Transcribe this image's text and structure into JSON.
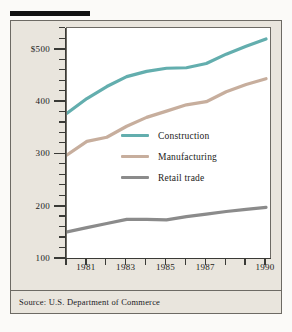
{
  "figure": {
    "source_note": "Source: U.S. Department of Commerce"
  },
  "legend": {
    "items": [
      {
        "label": "Construction",
        "color": "#63aeae"
      },
      {
        "label": "Manufacturing",
        "color": "#c7ae9d"
      },
      {
        "label": "Retail  trade",
        "color": "#8b8b8b"
      }
    ]
  },
  "axes": {
    "y_tick_labels": [
      "$500",
      "400",
      "300",
      "200",
      "100"
    ],
    "x_tick_labels": [
      "1981",
      "1983",
      "1985",
      "1987",
      "1990"
    ]
  },
  "colors": {
    "page_background": "#fbfaf8",
    "panel_background": "#e9e5dd",
    "plot_background": "#ffffff",
    "frame": "#6d6a64",
    "axis": "#3a3a36",
    "text": "#1b1b19",
    "top_rule": "#111111",
    "construction": "#63aeae",
    "manufacturing": "#c7ae9d",
    "retail_trade": "#8b8b8b"
  },
  "chart_data": {
    "type": "line",
    "title": "",
    "subtitle": "",
    "xlabel": "",
    "ylabel": "",
    "x": [
      1980,
      1981,
      1982,
      1983,
      1984,
      1985,
      1986,
      1987,
      1988,
      1989,
      1990
    ],
    "xlim": [
      1980,
      1990
    ],
    "ylim": [
      100,
      540
    ],
    "y_ticks_major": [
      100,
      200,
      300,
      400,
      500
    ],
    "y_ticks_minor_step": 20,
    "x_ticks": [
      1980,
      1981,
      1982,
      1983,
      1984,
      1985,
      1986,
      1987,
      1988,
      1989,
      1990
    ],
    "x_labeled_ticks": [
      1981,
      1983,
      1985,
      1987,
      1990
    ],
    "grid": false,
    "legend_position": "center-right",
    "series": [
      {
        "name": "Construction",
        "color": "#63aeae",
        "values": [
          377,
          405,
          428,
          447,
          457,
          463,
          464,
          472,
          490,
          505,
          519
        ]
      },
      {
        "name": "Manufacturing",
        "color": "#c7ae9d",
        "values": [
          297,
          323,
          331,
          352,
          369,
          381,
          393,
          399,
          418,
          432,
          443
        ]
      },
      {
        "name": "Retail trade",
        "color": "#8b8b8b",
        "values": [
          150,
          158,
          166,
          174,
          174,
          173,
          179,
          184,
          189,
          193,
          197
        ]
      }
    ],
    "annotations": [
      "Source: U.S. Department of Commerce"
    ]
  }
}
